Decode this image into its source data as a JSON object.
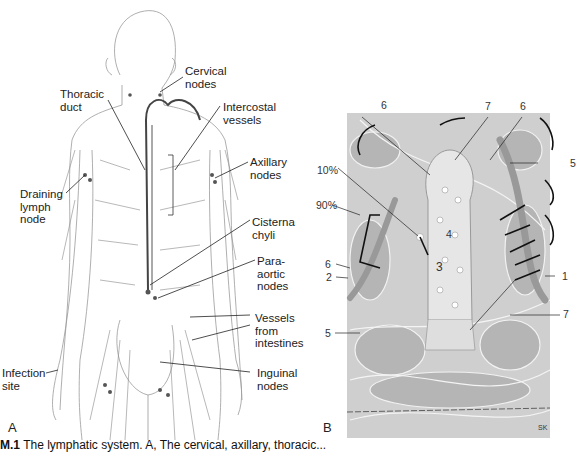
{
  "figure": {
    "panel_a": {
      "letter": "A",
      "labels": {
        "cervical": "Cervical\nnodes",
        "thoracic": "Thoracic\nduct",
        "intercostal": "Intercostal\nvessels",
        "axillary": "Axillary\nnodes",
        "draining": "Draining\nlymph\nnode",
        "cisterna": "Cisterna\nchyli",
        "paraaortic": "Para-\naortic\nnodes",
        "vessels_intestines": "Vessels\nfrom\nintestines",
        "infection": "Infection\nsite",
        "inguinal": "Inguinal\nnodes"
      }
    },
    "panel_b": {
      "letter": "B",
      "labels": {
        "top_left_6": "6",
        "top_7": "7",
        "top_right_6": "6",
        "right_5": "5",
        "pct_10": "10%",
        "pct_90": "90%",
        "mid_4": "4",
        "center_3": "3",
        "left_6": "6",
        "left_2": "2",
        "right_1": "1",
        "right_7": "7",
        "left_5": "5",
        "signature": "SK"
      }
    },
    "caption": {
      "figure_id": "M.1",
      "text": "The lymphatic system. A, The cervical, axillary, thoracic..."
    }
  }
}
